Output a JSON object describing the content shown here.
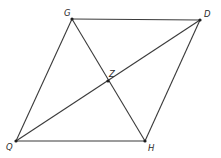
{
  "diagram": {
    "type": "parallelogram-with-diagonals",
    "points": {
      "G": {
        "label": "G",
        "x": 72,
        "y": 19,
        "lx": 64,
        "ly": 16
      },
      "D": {
        "label": "D",
        "x": 200,
        "y": 20,
        "lx": 204,
        "ly": 17
      },
      "H": {
        "label": "H",
        "x": 145,
        "y": 141,
        "lx": 148,
        "ly": 151
      },
      "Q": {
        "label": "Q",
        "x": 16,
        "y": 141,
        "lx": 6,
        "ly": 150
      },
      "Z": {
        "label": "Z",
        "x": 108,
        "y": 81,
        "lx": 109,
        "ly": 77
      }
    },
    "sides": [
      [
        "G",
        "D"
      ],
      [
        "D",
        "H"
      ],
      [
        "H",
        "Q"
      ],
      [
        "Q",
        "G"
      ]
    ],
    "diagonals": [
      [
        "Q",
        "D"
      ],
      [
        "G",
        "H"
      ]
    ],
    "colors": {
      "line": "#3a3a3a",
      "point": "#1e1e1e",
      "label": "#2a2a2a",
      "background": "#ffffff"
    }
  }
}
